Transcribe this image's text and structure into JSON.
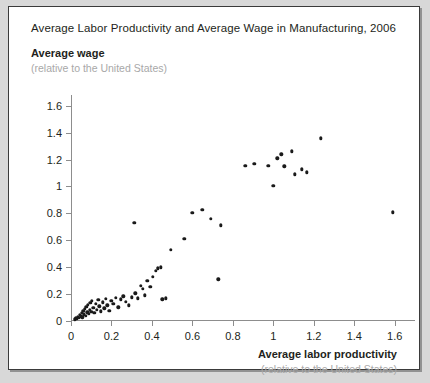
{
  "card": {
    "title": "Average Labor Productivity and Average Wage in Manufacturing, 2006",
    "y_axis_label": "Average wage",
    "y_axis_sublabel": "(relative to the United States)",
    "x_axis_label": "Average labor productivity",
    "x_axis_sublabel": "(relative to the United States)"
  },
  "chart_data": {
    "type": "scatter",
    "title": "Average Labor Productivity and Average Wage in Manufacturing, 2006",
    "xlabel": "Average labor productivity",
    "xlabel_sub": "(relative to the United States)",
    "ylabel": "Average wage",
    "ylabel_sub": "(relative to the United States)",
    "xlim": [
      0,
      1.7
    ],
    "ylim": [
      0,
      1.68
    ],
    "xticks": [
      0,
      0.2,
      0.4,
      0.6,
      0.8,
      1,
      1.2,
      1.4,
      1.6
    ],
    "xticklabels": [
      "0",
      "0.2",
      "0.4",
      "0.6",
      "0.8",
      "1",
      "1.2",
      "1.4",
      "1.6"
    ],
    "yticks": [
      0,
      0.2,
      0.4,
      0.6,
      0.8,
      1,
      1.2,
      1.4,
      1.6
    ],
    "yticklabels": [
      "0",
      "0.2",
      "0.4",
      "0.6",
      "0.8",
      "1",
      "1.2",
      "1.4",
      "1.6"
    ],
    "grid": false,
    "legend": null,
    "marker": "circle",
    "marker_color": "#1a1a1a",
    "points": [
      [
        0.018,
        0.012
      ],
      [
        0.025,
        0.02
      ],
      [
        0.03,
        0.016
      ],
      [
        0.034,
        0.03
      ],
      [
        0.04,
        0.024
      ],
      [
        0.044,
        0.045
      ],
      [
        0.048,
        0.034
      ],
      [
        0.052,
        0.06
      ],
      [
        0.056,
        0.028
      ],
      [
        0.06,
        0.075
      ],
      [
        0.064,
        0.05
      ],
      [
        0.068,
        0.09
      ],
      [
        0.072,
        0.038
      ],
      [
        0.076,
        0.105
      ],
      [
        0.08,
        0.066
      ],
      [
        0.084,
        0.12
      ],
      [
        0.088,
        0.055
      ],
      [
        0.092,
        0.082
      ],
      [
        0.096,
        0.135
      ],
      [
        0.1,
        0.07
      ],
      [
        0.104,
        0.148
      ],
      [
        0.11,
        0.098
      ],
      [
        0.116,
        0.06
      ],
      [
        0.122,
        0.128
      ],
      [
        0.128,
        0.085
      ],
      [
        0.134,
        0.158
      ],
      [
        0.14,
        0.11
      ],
      [
        0.148,
        0.072
      ],
      [
        0.156,
        0.14
      ],
      [
        0.164,
        0.095
      ],
      [
        0.172,
        0.165
      ],
      [
        0.18,
        0.118
      ],
      [
        0.19,
        0.078
      ],
      [
        0.2,
        0.15
      ],
      [
        0.21,
        0.128
      ],
      [
        0.222,
        0.172
      ],
      [
        0.234,
        0.102
      ],
      [
        0.246,
        0.16
      ],
      [
        0.258,
        0.185
      ],
      [
        0.272,
        0.142
      ],
      [
        0.286,
        0.118
      ],
      [
        0.3,
        0.175
      ],
      [
        0.312,
        0.73
      ],
      [
        0.318,
        0.205
      ],
      [
        0.33,
        0.168
      ],
      [
        0.344,
        0.262
      ],
      [
        0.356,
        0.24
      ],
      [
        0.366,
        0.19
      ],
      [
        0.378,
        0.3
      ],
      [
        0.392,
        0.255
      ],
      [
        0.404,
        0.33
      ],
      [
        0.418,
        0.372
      ],
      [
        0.43,
        0.392
      ],
      [
        0.444,
        0.4
      ],
      [
        0.452,
        0.16
      ],
      [
        0.47,
        0.168
      ],
      [
        0.492,
        0.53
      ],
      [
        0.56,
        0.612
      ],
      [
        0.6,
        0.805
      ],
      [
        0.648,
        0.828
      ],
      [
        0.69,
        0.76
      ],
      [
        0.728,
        0.31
      ],
      [
        0.74,
        0.712
      ],
      [
        0.862,
        1.152
      ],
      [
        0.905,
        1.168
      ],
      [
        0.975,
        1.152
      ],
      [
        1.0,
        1.005
      ],
      [
        1.02,
        1.208
      ],
      [
        1.04,
        1.238
      ],
      [
        1.055,
        1.15
      ],
      [
        1.09,
        1.262
      ],
      [
        1.105,
        1.09
      ],
      [
        1.14,
        1.128
      ],
      [
        1.165,
        1.105
      ],
      [
        1.235,
        1.358
      ],
      [
        1.59,
        0.808
      ]
    ]
  }
}
